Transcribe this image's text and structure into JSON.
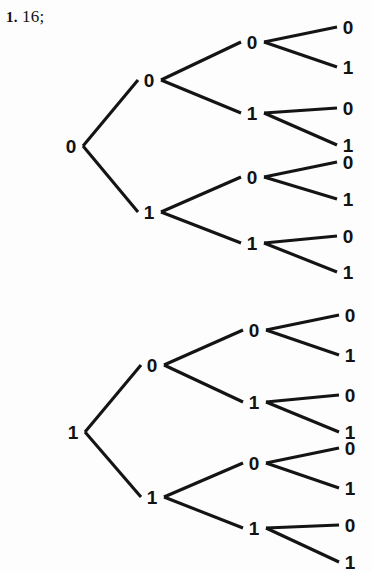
{
  "answer": {
    "number": "1.",
    "value": "16;",
    "full_text": "1. 16;"
  },
  "colors": {
    "ink": "#141414",
    "background": "#fdfdfd"
  },
  "figure": {
    "type": "binary-tree-diagram",
    "total_leaves": 16,
    "trees": [
      {
        "id": "tree-top",
        "root_label": "0",
        "root": {
          "x": 71,
          "y": 146,
          "label": "0"
        },
        "level2": [
          {
            "x": 149,
            "y": 80,
            "label": "0"
          },
          {
            "x": 149,
            "y": 212,
            "label": "1"
          }
        ],
        "level3": [
          {
            "x": 252,
            "y": 42,
            "label": "0"
          },
          {
            "x": 252,
            "y": 113,
            "label": "1"
          },
          {
            "x": 252,
            "y": 177,
            "label": "0"
          },
          {
            "x": 252,
            "y": 243,
            "label": "1"
          }
        ],
        "leaves": [
          {
            "x": 348,
            "y": 27,
            "label": "0"
          },
          {
            "x": 348,
            "y": 67,
            "label": "1"
          },
          {
            "x": 348,
            "y": 108,
            "label": "0"
          },
          {
            "x": 348,
            "y": 145,
            "label": "1"
          },
          {
            "x": 348,
            "y": 162,
            "label": "0"
          },
          {
            "x": 348,
            "y": 199,
            "label": "1"
          },
          {
            "x": 348,
            "y": 236,
            "label": "0"
          },
          {
            "x": 348,
            "y": 272,
            "label": "1"
          }
        ]
      },
      {
        "id": "tree-bottom",
        "root_label": "1",
        "root": {
          "x": 73,
          "y": 432,
          "label": "1"
        },
        "level2": [
          {
            "x": 152,
            "y": 365,
            "label": "0"
          },
          {
            "x": 152,
            "y": 497,
            "label": "1"
          }
        ],
        "level3": [
          {
            "x": 254,
            "y": 330,
            "label": "0"
          },
          {
            "x": 254,
            "y": 402,
            "label": "1"
          },
          {
            "x": 254,
            "y": 463,
            "label": "0"
          },
          {
            "x": 254,
            "y": 528,
            "label": "1"
          }
        ],
        "leaves": [
          {
            "x": 350,
            "y": 315,
            "label": "0"
          },
          {
            "x": 350,
            "y": 355,
            "label": "1"
          },
          {
            "x": 350,
            "y": 395,
            "label": "0"
          },
          {
            "x": 350,
            "y": 432,
            "label": "1"
          },
          {
            "x": 350,
            "y": 448,
            "label": "0"
          },
          {
            "x": 350,
            "y": 488,
            "label": "1"
          },
          {
            "x": 350,
            "y": 525,
            "label": "0"
          },
          {
            "x": 350,
            "y": 562,
            "label": "1"
          }
        ]
      }
    ]
  }
}
